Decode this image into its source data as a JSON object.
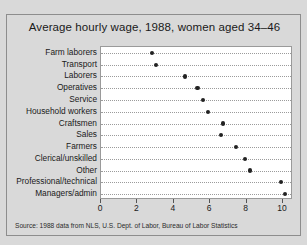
{
  "chart_data": {
    "type": "scatter",
    "title": "Average hourly wage, 1988, women aged 34–46",
    "xlabel": "",
    "ylabel": "",
    "source": "Source: 1988 data from NLS, U.S. Dept. of Labor, Bureau of Labor Statistics",
    "xlim": [
      0,
      10.55
    ],
    "grid": true,
    "legend": null,
    "xticks": [
      0,
      2,
      4,
      6,
      8,
      10
    ],
    "xticklabels": [
      "0",
      "2",
      "4",
      "6",
      "8",
      "10"
    ],
    "categories": [
      "Farm laborers",
      "Transport",
      "Laborers",
      "Operatives",
      "Service",
      "Household workers",
      "Craftsmen",
      "Sales",
      "Farmers",
      "Clerical/unskilled",
      "Other",
      "Professional/technical",
      "Managers/admin"
    ],
    "values": [
      2.8,
      3.0,
      4.6,
      5.3,
      5.6,
      5.9,
      6.7,
      6.6,
      7.4,
      7.9,
      8.2,
      9.9,
      10.1
    ]
  }
}
